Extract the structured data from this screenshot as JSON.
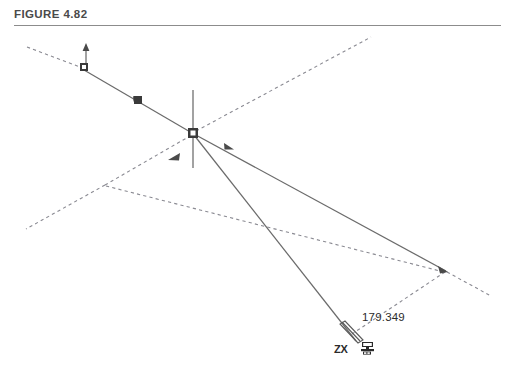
{
  "figure": {
    "title": "FIGURE 4.82",
    "rule_color": "#8c8c8c",
    "background": "#ffffff"
  },
  "annotations": {
    "dimension_value": "179.349",
    "axis_label": "ZX",
    "axis_icon": "zx-coordinate-system-icon"
  },
  "colors": {
    "line_solid": "#6b6b6b",
    "line_dashed": "#8a8a92",
    "node_fill": "#3a3a3a",
    "text": "#2b2b2b",
    "title_text": "#4a4a4a"
  },
  "geometry": {
    "description": "CAD-style 3D wireframe figure with solid construction lines, dashed projection lines, square grip nodes, and direction arrows",
    "center_node": {
      "x": 193,
      "y": 133
    },
    "upper_left_node": {
      "x": 82,
      "y": 68
    },
    "mid_node": {
      "x": 138,
      "y": 100
    },
    "right_vertex": {
      "x": 446,
      "y": 271
    },
    "left_vertex": {
      "x": 105,
      "y": 185
    },
    "pointer_tip": {
      "x": 357,
      "y": 345
    },
    "vertical_line": {
      "x": 193,
      "y_top": 90,
      "y_bottom": 168
    },
    "dashed_end_top_right": {
      "x": 371,
      "y": 37
    },
    "dashed_end_top_left": {
      "x": 27,
      "y": 47
    },
    "dashed_end_bottom_right": {
      "x": 491,
      "y": 296
    },
    "dashed_end_bottom_left": {
      "x": 26,
      "y": 229
    }
  }
}
